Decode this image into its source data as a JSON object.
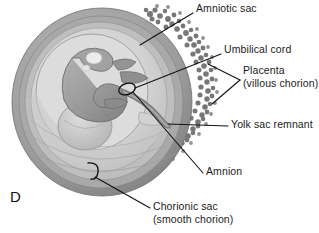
{
  "figure": {
    "panel_letter": "D",
    "style": "grayscale-anatomical-illustration"
  },
  "colors": {
    "background": "#ffffff",
    "leader_line": "#121212",
    "text": "#1b1b1b",
    "sac_outer_rim": "#8d8d8d",
    "sac_ring_mid": "#a8a8a8",
    "sac_ring_inner": "#bdbdbd",
    "cavity_fill": "#cfcfcf",
    "amniotic_cavity": "#d9d9d9",
    "villi": "#6f6f6f",
    "villi_light": "#9a9a9a",
    "embryo_body": "#9b9b9b",
    "embryo_shadow": "#7a7a7a",
    "yolk_sac": "#c6c6c6",
    "cord": "#8f8f8f",
    "highlight": "#efefef"
  },
  "labels": [
    {
      "id": "amniotic-sac",
      "lines": [
        "Amniotic sac"
      ],
      "text_x": 196,
      "text_y": 3,
      "leader": [
        [
          193,
          13
        ],
        [
          140,
          45
        ]
      ],
      "arrow": "none"
    },
    {
      "id": "umbilical-cord",
      "lines": [
        "Umbilical cord"
      ],
      "text_x": 224,
      "text_y": 44,
      "leader": [
        [
          221,
          54
        ],
        [
          135,
          88
        ]
      ],
      "arrow": "none"
    },
    {
      "id": "placenta",
      "lines": [
        "Placenta",
        "(villous chorion)"
      ],
      "text_x": 243,
      "text_y": 70,
      "leader_fork": [
        [
          [
            240,
            83
          ],
          [
            208,
            64
          ]
        ],
        [
          [
            240,
            83
          ],
          [
            212,
            104
          ]
        ]
      ],
      "arrow": "none"
    },
    {
      "id": "yolk-sac-remnant",
      "lines": [
        "Yolk sac remnant"
      ],
      "text_x": 231,
      "text_y": 119,
      "leader": [
        [
          228,
          126
        ],
        [
          168,
          124
        ]
      ],
      "arrow": "none"
    },
    {
      "id": "amnion",
      "lines": [
        "Amnion"
      ],
      "text_x": 206,
      "text_y": 166,
      "leader": [
        [
          203,
          173
        ],
        [
          133,
          88
        ]
      ],
      "arrow": "none"
    },
    {
      "id": "chorionic-sac",
      "lines": [
        "Chorionic sac",
        "(smooth chorion)"
      ],
      "text_x": 153,
      "text_y": 205,
      "leader": [
        [
          150,
          208
        ],
        [
          93,
          176
        ]
      ],
      "arrow": "none"
    }
  ]
}
